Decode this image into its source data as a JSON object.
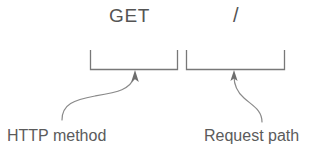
{
  "diagram": {
    "background_color": "#ffffff",
    "line_color": "#6b6b6b",
    "text_color": "#545454",
    "label_color": "#5b5b5b",
    "request_line": {
      "method": "GET",
      "path": "/"
    },
    "annotations": [
      {
        "label": "HTTP method",
        "target_token": "GET",
        "brace_name": "method-brace",
        "arrow_name": "method-arrow"
      },
      {
        "label": "Request path",
        "target_token": "/",
        "brace_name": "path-brace",
        "arrow_name": "path-arrow"
      }
    ]
  }
}
